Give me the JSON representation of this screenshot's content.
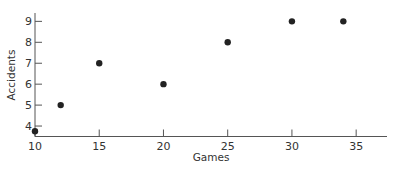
{
  "chart_data": {
    "type": "scatter",
    "title": "",
    "xlabel": "Games",
    "ylabel": "Accidents",
    "x": [
      10,
      12,
      15,
      20,
      25,
      30,
      34
    ],
    "y": [
      3.75,
      5,
      7,
      6,
      8,
      9,
      9
    ],
    "series": [
      {
        "name": "Accidents vs Games",
        "x": [
          10,
          12,
          15,
          20,
          25,
          30,
          34
        ],
        "y": [
          3.75,
          5,
          7,
          6,
          8,
          9,
          9
        ]
      }
    ],
    "xticks": [
      10,
      15,
      20,
      25,
      30,
      35
    ],
    "yticks": [
      4,
      5,
      6,
      7,
      8,
      9
    ],
    "xlim": [
      10,
      37.4
    ],
    "ylim": [
      3.5,
      9.4
    ],
    "grid": false,
    "legend": null,
    "colors": {
      "axis": "#555555",
      "point": "#222222",
      "text": "#333333"
    }
  }
}
